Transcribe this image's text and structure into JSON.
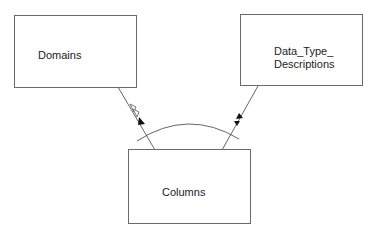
{
  "diagram": {
    "type": "entity-relationship",
    "entities": [
      {
        "id": "domains",
        "label": "Domains"
      },
      {
        "id": "data_type_descriptions",
        "label_line1": "Data_Type_",
        "label_line2": "Descriptions"
      },
      {
        "id": "columns",
        "label": "Columns"
      }
    ],
    "relationships": [
      {
        "from": "columns",
        "to": "domains",
        "arrow": "open-and-filled"
      },
      {
        "from": "columns",
        "to": "data_type_descriptions",
        "arrow": "double-filled"
      }
    ],
    "constraint_arc": "spans both relationships"
  }
}
